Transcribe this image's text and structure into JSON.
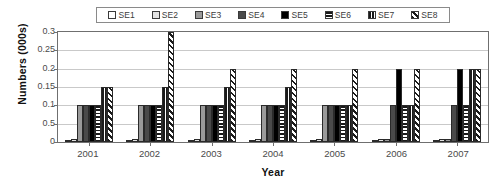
{
  "chart_data": {
    "type": "bar",
    "title": "",
    "xlabel": "Year",
    "ylabel": "Numbers (000s)",
    "categories": [
      "2001",
      "2002",
      "2003",
      "2004",
      "2005",
      "2006",
      "2007"
    ],
    "ylim": [
      0,
      0.3
    ],
    "ytick_labels": [
      "0.3",
      "0.25",
      "0.2",
      "0.15",
      "0.1",
      "0.5",
      "0"
    ],
    "ytick_values": [
      0.3,
      0.25,
      0.2,
      0.15,
      0.1,
      0.05,
      0
    ],
    "grid": true,
    "legend_position": "top",
    "series": [
      {
        "name": "SE1",
        "pattern": "solid-white",
        "values": [
          0.005,
          0.005,
          0.005,
          0.005,
          0.005,
          0.005,
          0.005
        ]
      },
      {
        "name": "SE2",
        "pattern": "solid-light-gray",
        "values": [
          0.008,
          0.008,
          0.008,
          0.008,
          0.008,
          0.008,
          0.008
        ]
      },
      {
        "name": "SE3",
        "pattern": "solid-mid-gray",
        "values": [
          0.1,
          0.1,
          0.1,
          0.1,
          0.1,
          0.008,
          0.008
        ]
      },
      {
        "name": "SE4",
        "pattern": "solid-dark-gray",
        "values": [
          0.1,
          0.1,
          0.1,
          0.1,
          0.1,
          0.1,
          0.1
        ]
      },
      {
        "name": "SE5",
        "pattern": "solid-black",
        "values": [
          0.1,
          0.1,
          0.1,
          0.1,
          0.1,
          0.2,
          0.2
        ]
      },
      {
        "name": "SE6",
        "pattern": "horizontal-lines",
        "values": [
          0.1,
          0.1,
          0.1,
          0.1,
          0.1,
          0.1,
          0.1
        ]
      },
      {
        "name": "SE7",
        "pattern": "vertical-lines",
        "values": [
          0.15,
          0.15,
          0.15,
          0.15,
          0.1,
          0.1,
          0.2
        ]
      },
      {
        "name": "SE8",
        "pattern": "diagonal-hatch",
        "values": [
          0.15,
          0.3,
          0.2,
          0.2,
          0.2,
          0.2,
          0.2
        ]
      }
    ]
  },
  "legend": {
    "items": [
      {
        "label": "SE1",
        "swatch_class": "pat-se1",
        "icon": "legend-swatch-white-icon"
      },
      {
        "label": "SE2",
        "swatch_class": "pat-se2",
        "icon": "legend-swatch-light-gray-icon"
      },
      {
        "label": "SE3",
        "swatch_class": "pat-se3",
        "icon": "legend-swatch-mid-gray-icon"
      },
      {
        "label": "SE4",
        "swatch_class": "pat-se4",
        "icon": "legend-swatch-dark-gray-icon"
      },
      {
        "label": "SE5",
        "swatch_class": "pat-se5",
        "icon": "legend-swatch-black-icon"
      },
      {
        "label": "SE6",
        "swatch_class": "pat-se6",
        "icon": "legend-swatch-horizontal-lines-icon"
      },
      {
        "label": "SE7",
        "swatch_class": "pat-se7",
        "icon": "legend-swatch-vertical-lines-icon"
      },
      {
        "label": "SE8",
        "swatch_class": "pat-se8",
        "icon": "legend-swatch-diagonal-hatch-icon"
      }
    ]
  },
  "colors": {
    "axis": "#6f6f6f",
    "grid": "#c9c9c9",
    "text": "#3b3b3b",
    "title_text": "#111111",
    "background": "#ffffff"
  }
}
